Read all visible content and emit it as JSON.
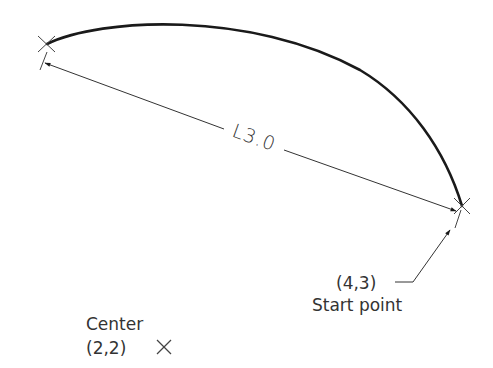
{
  "diagram": {
    "arc_length_label": "L3.0",
    "start_point": {
      "coords": "(4,3)",
      "label": "Start point"
    },
    "center": {
      "label": "Center",
      "coords": "(2,2)"
    },
    "colors": {
      "stroke": "#1a1a1a",
      "text": "#333333",
      "background": "#ffffff"
    }
  }
}
